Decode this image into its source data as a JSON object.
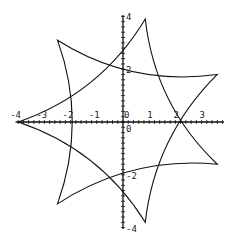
{
  "chart_data": {
    "type": "line",
    "title": "",
    "xlabel": "",
    "ylabel": "",
    "xlim": [
      -4,
      3.8
    ],
    "ylim": [
      -4,
      4
    ],
    "x_ticks": [
      "-4",
      "-3",
      "-2",
      "-1",
      "0",
      "1",
      "2",
      "3"
    ],
    "y_ticks": [
      "4",
      "2",
      "0",
      "-2",
      "-4"
    ],
    "grid": false,
    "legend": null,
    "series": [
      {
        "name": "curve",
        "cusps": [
          {
            "x": -4.0,
            "y": 0.0
          },
          {
            "x": -2.5,
            "y": 3.1
          },
          {
            "x": 0.85,
            "y": 3.9
          },
          {
            "x": 3.6,
            "y": 1.8
          },
          {
            "x": 3.6,
            "y": -1.6
          },
          {
            "x": 0.85,
            "y": -3.8
          },
          {
            "x": -2.5,
            "y": -3.1
          }
        ],
        "axis_crossings": {
          "x": [
            -2.0,
            2.2
          ],
          "y": [
            3.0,
            2.1,
            -1.9,
            -2.9
          ]
        }
      }
    ]
  },
  "axes": {
    "x_labels": [
      "-4",
      "-3",
      "-2",
      "-1",
      "0",
      "1",
      "2",
      "3"
    ],
    "y_labels": [
      "4",
      "2",
      "-2",
      "-4"
    ]
  }
}
